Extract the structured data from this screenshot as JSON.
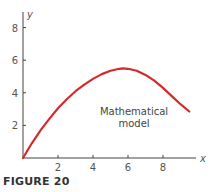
{
  "figure": {
    "caption": "FIGURE 20"
  },
  "chart_data": {
    "type": "line",
    "title": "",
    "xlabel": "x",
    "ylabel": "y",
    "xlim": [
      0,
      9.8
    ],
    "ylim": [
      0,
      8.5
    ],
    "xticks": [
      2,
      4,
      6,
      8
    ],
    "yticks": [
      2,
      4,
      6,
      8
    ],
    "grid": false,
    "legend": null,
    "annotations": [
      {
        "text": "Mathematical model",
        "x": 6.3,
        "y": 3.0
      }
    ],
    "series": [
      {
        "name": "Mathematical model",
        "color": "#d42a2a",
        "x": [
          0,
          0.5,
          1,
          1.5,
          2,
          2.5,
          3,
          3.5,
          4,
          4.5,
          5,
          5.5,
          5.7,
          6,
          6.5,
          7,
          7.5,
          8,
          8.5,
          9,
          9.5
        ],
        "y": [
          0,
          0.9,
          1.7,
          2.4,
          3.05,
          3.6,
          4.1,
          4.5,
          4.85,
          5.15,
          5.35,
          5.47,
          5.5,
          5.47,
          5.35,
          5.1,
          4.75,
          4.3,
          3.8,
          3.3,
          2.85
        ]
      }
    ]
  },
  "colors": {
    "curve": "#d42a2a",
    "axis": "#444444",
    "text": "#555555"
  }
}
